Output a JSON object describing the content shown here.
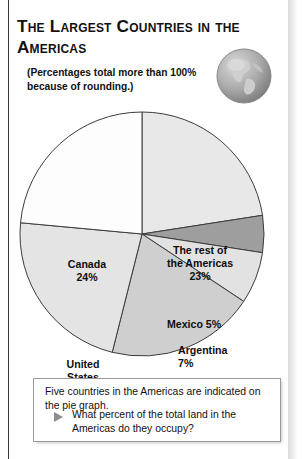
{
  "title": "The Largest Countries in the Americas",
  "note": "(Percentages total more than 100% because of rounding.)",
  "globe_icon": "globe-americas-icon",
  "caption": {
    "line1": "Five countries in the Americas are indicated on the pie graph.",
    "bullet_icon": "triangle-bullet-icon",
    "question": "What percent of the total land in the Americas do they occupy?"
  },
  "labels": {
    "canada": "Canada\n24%",
    "rest": "The rest of\nthe Americas\n23%",
    "mexico": "Mexico 5%",
    "argentina": "Argentina\n7%",
    "brazil": "Brazil\n20%",
    "united_states": "United\nStates\n23%"
  },
  "chart_data": {
    "type": "pie",
    "title": "The Largest Countries in the Americas",
    "unit": "percent",
    "note": "(Percentages total more than 100% because of rounding.)",
    "total": 102,
    "legend": "none (labels placed inside slices)",
    "start_angle_deg": 0,
    "direction": "clockwise",
    "categories": [
      "The rest of the Americas",
      "Mexico",
      "Argentina",
      "Brazil",
      "United States",
      "Canada"
    ],
    "values": [
      23,
      5,
      7,
      20,
      23,
      24
    ],
    "slices": [
      {
        "label": "The rest of the Americas",
        "value": 23,
        "display": "23%",
        "color": "#e8e8e8"
      },
      {
        "label": "Mexico",
        "value": 5,
        "display": "5%",
        "color": "#9e9e9e"
      },
      {
        "label": "Argentina",
        "value": 7,
        "display": "7%",
        "color": "#e2e2e2"
      },
      {
        "label": "Brazil",
        "value": 20,
        "display": "20%",
        "color": "#cfcfcf"
      },
      {
        "label": "United States",
        "value": 23,
        "display": "23%",
        "color": "#e4e4e4"
      },
      {
        "label": "Canada",
        "value": 24,
        "display": "24%",
        "color": "#fdfdfd"
      }
    ],
    "stroke_color": "#3c3c3c"
  },
  "geometry": {
    "cx": 142,
    "cy": 138,
    "r": 122
  }
}
